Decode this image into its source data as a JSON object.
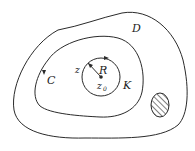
{
  "diagram": {
    "labels": {
      "region": "D",
      "contour": "C",
      "circle": "K",
      "radius": "R",
      "point": "z",
      "center": "z",
      "center_sub": "0"
    },
    "colors": {
      "stroke": "#2a2a2a",
      "background": "#ffffff"
    },
    "elements": [
      {
        "name": "outer-region-boundary",
        "label": "D"
      },
      {
        "name": "contour-C",
        "label": "C",
        "orientation": "counterclockwise arrow on left side"
      },
      {
        "name": "circle-K",
        "label": "K",
        "center": "z0",
        "radius_label": "R"
      },
      {
        "name": "hatched-hole",
        "label": ""
      }
    ]
  }
}
